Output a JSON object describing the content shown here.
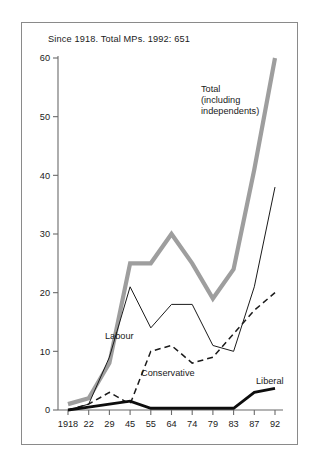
{
  "figure": {
    "caption": "Since 1918.  Total MPs. 1992: 651",
    "labels": {
      "total": "Total",
      "total_line2": "(including",
      "total_line3": "independents)",
      "labour": "Labour",
      "conservative": "Conservative",
      "liberal": "Liberal"
    }
  },
  "chart_data": {
    "type": "line",
    "title": "Since 1918.  Total MPs. 1992: 651",
    "xlabel": "",
    "ylabel": "",
    "categories": [
      "1918",
      "22",
      "29",
      "45",
      "55",
      "64",
      "74",
      "79",
      "83",
      "87",
      "92"
    ],
    "xtick_labels": [
      "1918",
      "22",
      "29",
      "45",
      "55",
      "64",
      "74",
      "79",
      "83",
      "87",
      "92"
    ],
    "ytick_labels": [
      "0",
      "10",
      "20",
      "30",
      "40",
      "50",
      "60"
    ],
    "yticks": [
      0,
      10,
      20,
      30,
      40,
      50,
      60
    ],
    "ylim": [
      0,
      60
    ],
    "grid": false,
    "legend": "inline-annotations",
    "series": [
      {
        "name": "Total (including independents)",
        "style": "thick-grey",
        "color": "#9e9e9e",
        "values": [
          1,
          2,
          8,
          25,
          25,
          30,
          25,
          19,
          24,
          41,
          60
        ]
      },
      {
        "name": "Labour",
        "style": "thin-black",
        "color": "#1a1a1a",
        "values": [
          0,
          1,
          9,
          21,
          14,
          18,
          18,
          11,
          10,
          21,
          38
        ]
      },
      {
        "name": "Conservative",
        "style": "dashed-black",
        "color": "#1a1a1a",
        "values": [
          0,
          1,
          3,
          1,
          10,
          11,
          8,
          9,
          13,
          17,
          20
        ]
      },
      {
        "name": "Liberal",
        "style": "thick-black",
        "color": "#0d0d0d",
        "values": [
          0,
          0.5,
          1,
          1.5,
          0.3,
          0.3,
          0.3,
          0.3,
          0.3,
          3,
          3.7
        ]
      }
    ],
    "annotations": [
      {
        "text": "Total",
        "x": "83",
        "y": 52
      },
      {
        "text": "(including",
        "x": "83",
        "y": 49
      },
      {
        "text": "independents)",
        "x": "83",
        "y": 46
      },
      {
        "text": "Labour",
        "x": "45",
        "y": 13
      },
      {
        "text": "Conservative",
        "x": "55",
        "y": 6
      },
      {
        "text": "Liberal",
        "x": "87",
        "y": 7
      }
    ]
  }
}
